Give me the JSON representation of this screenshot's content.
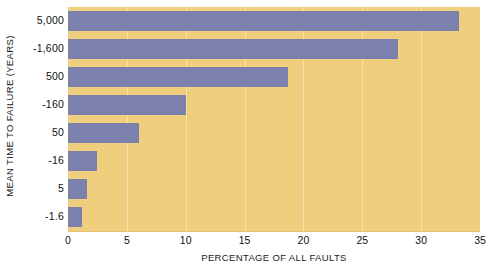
{
  "chart_data": {
    "type": "bar",
    "orientation": "horizontal",
    "title": "",
    "xlabel": "PERCENTAGE OF ALL FAULTS",
    "ylabel": "MEAN TIME TO FAILURE (YEARS)",
    "categories": [
      "5,000",
      "-1,600",
      "500",
      "-160",
      "50",
      "-16",
      "5",
      "-1.6"
    ],
    "values": [
      33.2,
      28.0,
      18.7,
      10.0,
      6.0,
      2.5,
      1.6,
      1.2
    ],
    "xticks": [
      "0",
      "5",
      "10",
      "15",
      "20",
      "25",
      "30",
      "35"
    ],
    "xtick_values": [
      0,
      5,
      10,
      15,
      20,
      25,
      30,
      35
    ],
    "xlim": [
      0,
      35
    ],
    "grid": "vertical",
    "legend": "none",
    "colors": {
      "bar": "#7b80ad",
      "plot_background": "#efce7e",
      "gridline": "#f6e3ad",
      "text": "#111111",
      "page_background": "#ffffff"
    }
  }
}
